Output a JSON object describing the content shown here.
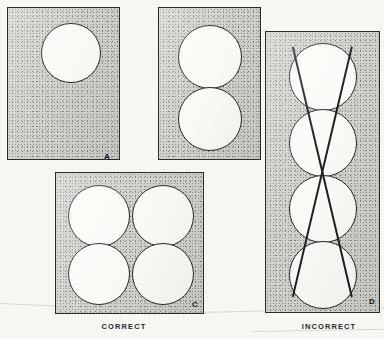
{
  "figure": {
    "captions": [
      {
        "text": "CORRECT",
        "x": 79,
        "y": 322,
        "width": 90
      },
      {
        "text": "INCORRECT",
        "x": 286,
        "y": 322,
        "width": 86
      }
    ]
  },
  "panels": [
    {
      "id": "panel-a",
      "label": "A",
      "x": 7,
      "y": 7,
      "width": 111,
      "height": 151,
      "label_x": 96,
      "label_y": 145,
      "blanks": [
        {
          "cx": 62,
          "cy": 44,
          "r": 29
        }
      ],
      "cutlines": []
    },
    {
      "id": "panel-b",
      "label": "B",
      "x": 158,
      "y": 7,
      "width": 101,
      "height": 151,
      "label_x": 240,
      "label_y": 145,
      "blanks": [
        {
          "cx": 50,
          "cy": 48,
          "r": 31
        },
        {
          "cx": 50,
          "cy": 110,
          "r": 31
        }
      ],
      "cutlines": []
    },
    {
      "id": "panel-c",
      "label": "C",
      "x": 55,
      "y": 172,
      "width": 147,
      "height": 140,
      "label_x": 136,
      "label_y": 128,
      "blanks": [
        {
          "cx": 42,
          "cy": 42,
          "r": 30
        },
        {
          "cx": 106,
          "cy": 42,
          "r": 30
        },
        {
          "cx": 42,
          "cy": 100,
          "r": 30
        },
        {
          "cx": 106,
          "cy": 100,
          "r": 30
        }
      ],
      "cutlines": []
    },
    {
      "id": "panel-d",
      "label": "D",
      "x": 265,
      "y": 31,
      "width": 113,
      "height": 280,
      "label_x": 103,
      "label_y": 266,
      "blanks": [
        {
          "cx": 56,
          "cy": 44,
          "r": 33
        },
        {
          "cx": 56,
          "cy": 110,
          "r": 33
        },
        {
          "cx": 56,
          "cy": 176,
          "r": 33
        },
        {
          "cx": 56,
          "cy": 242,
          "r": 33
        }
      ],
      "cutlines": [
        {
          "x1": 27,
          "y1": 14,
          "x2": 86,
          "y2": 264
        },
        {
          "x1": 86,
          "y1": 14,
          "x2": 27,
          "y2": 264
        }
      ]
    }
  ],
  "scan_lines": [
    {
      "x": 0,
      "y": 303,
      "length": 205,
      "angle": 2.6
    },
    {
      "x": 200,
      "y": 312,
      "length": 184,
      "angle": -1.4
    },
    {
      "x": 252,
      "y": 331,
      "length": 132,
      "angle": -1.0
    }
  ]
}
